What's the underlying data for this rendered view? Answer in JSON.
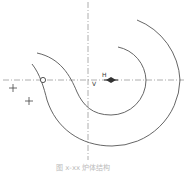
{
  "diagram": {
    "labels": {
      "h_point": "H",
      "v_point": "V"
    },
    "caption": "图 x-xx  炉体结构",
    "colors": {
      "line": "#555555",
      "axis": "#9a9a9a",
      "marker": "#333333"
    },
    "elements": [
      "horizontal-centerline",
      "vertical-centerline",
      "inner-spiral-curve",
      "outer-spiral-curve",
      "circle-marker",
      "diamond-marker",
      "cross-marker",
      "cross-marker"
    ]
  }
}
